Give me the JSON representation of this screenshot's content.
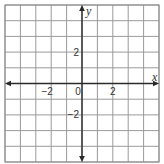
{
  "chart_data": {
    "type": "scatter",
    "title": "",
    "xlabel": "x",
    "ylabel": "y",
    "xlim": [
      -5,
      5
    ],
    "ylim": [
      -5,
      5
    ],
    "grid": true,
    "grid_step": 1,
    "x_ticks": [
      {
        "value": -2,
        "label": "−2"
      },
      {
        "value": 0,
        "label": "0"
      },
      {
        "value": 2,
        "label": "2"
      }
    ],
    "y_ticks": [
      {
        "value": 2,
        "label": "2"
      },
      {
        "value": -2,
        "label": "−2"
      }
    ],
    "series": [],
    "axis_arrows": [
      "left",
      "right",
      "up",
      "down"
    ]
  }
}
